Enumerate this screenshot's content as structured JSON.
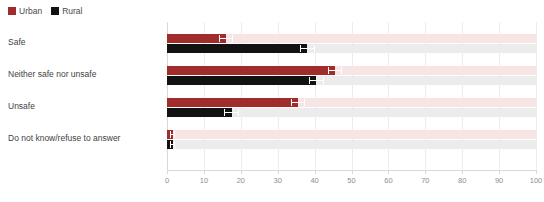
{
  "legend": {
    "position": "top-left",
    "entries": [
      {
        "label": "Urban",
        "color": "#a02c2c",
        "icon": "legend-swatch-icon"
      },
      {
        "label": "Rural",
        "color": "#121212",
        "icon": "legend-swatch-icon"
      }
    ]
  },
  "chart_data": {
    "type": "bar",
    "orientation": "horizontal",
    "title": "",
    "subtitle": "",
    "xlabel": "",
    "ylabel": "",
    "xlim": [
      0,
      100
    ],
    "xticks": [
      0,
      10,
      20,
      30,
      40,
      50,
      60,
      70,
      80,
      90,
      100
    ],
    "xtick_labels": [
      "0",
      "10",
      "20",
      "30",
      "40",
      "50",
      "60",
      "70",
      "80",
      "90",
      "100"
    ],
    "grid": true,
    "grid_axis": "x",
    "legend_position": "top-left",
    "categories": [
      "Safe",
      "Neither safe nor unsafe",
      "Unsafe",
      "Do not know/refuse to answer"
    ],
    "series": [
      {
        "name": "Urban",
        "color": "#a02c2c",
        "values": [
          16,
          45.5,
          35.5,
          1.5
        ]
      },
      {
        "name": "Rural",
        "color": "#121212",
        "values": [
          38,
          40.5,
          17.5,
          1.5
        ]
      }
    ],
    "error_bars": {
      "shown": true,
      "Urban": [
        2.0,
        2.0,
        2.0,
        0.8
      ],
      "Rural": [
        2.0,
        2.0,
        2.0,
        0.8
      ]
    },
    "track_colors": {
      "Urban": "#f7e5e5",
      "Rural": "#ececec"
    }
  }
}
